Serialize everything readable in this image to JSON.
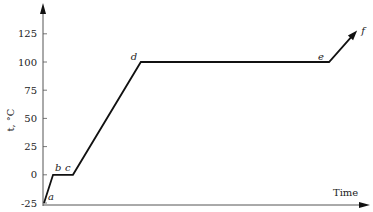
{
  "chart_data": {
    "type": "line",
    "title": "",
    "xlabel": "Time",
    "ylabel": "t, °C",
    "ylim": [
      -25,
      140
    ],
    "yticks": [
      -25,
      0,
      25,
      50,
      75,
      100,
      125
    ],
    "ytick_labels": [
      "-25",
      "0",
      "25",
      "50",
      "75",
      "100",
      "125"
    ],
    "grid": false,
    "legend": null,
    "series": [
      {
        "name": "heating curve",
        "points": [
          {
            "label": "a",
            "x": 0,
            "y": -25
          },
          {
            "label": "b",
            "x": 1,
            "y": 0
          },
          {
            "label": "c",
            "x": 3.2,
            "y": 0
          },
          {
            "label": "d",
            "x": 10.7,
            "y": 100
          },
          {
            "label": "e",
            "x": 31.5,
            "y": 100
          },
          {
            "label": "f",
            "x": 34.6,
            "y": 128
          }
        ]
      }
    ],
    "point_labels": [
      "a",
      "b",
      "c",
      "d",
      "e",
      "f"
    ]
  },
  "axes": {
    "x_title": "Time",
    "y_title": "t, °C"
  }
}
